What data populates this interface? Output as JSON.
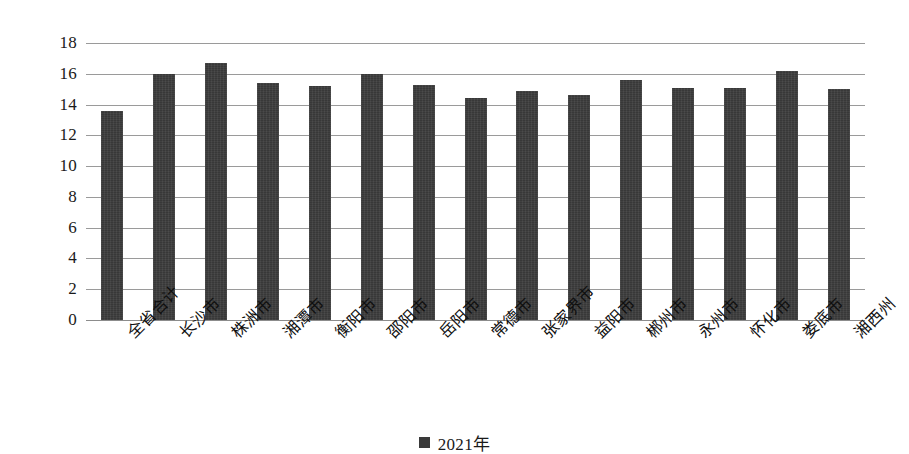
{
  "chart_data": {
    "type": "bar",
    "title": "",
    "xlabel": "",
    "ylabel": "",
    "ylim": [
      0,
      18
    ],
    "ytick_step": 2,
    "yticks": [
      18,
      16,
      14,
      12,
      10,
      8,
      6,
      4,
      2,
      0
    ],
    "grid": true,
    "legend_position": "bottom",
    "legend": [
      "2021年"
    ],
    "series_name": "2021年",
    "bar_color": "#383838",
    "gridline_color": "#9a9a9a",
    "categories": [
      "全省合计",
      "长沙市",
      "株洲市",
      "湘潭市",
      "衡阳市",
      "邵阳市",
      "岳阳市",
      "常德市",
      "张家界市",
      "益阳市",
      "郴州市",
      "永州市",
      "怀化市",
      "娄底市",
      "湘西州"
    ],
    "values": [
      13.6,
      16.0,
      16.7,
      15.4,
      15.2,
      16.0,
      15.3,
      14.4,
      14.9,
      14.6,
      15.6,
      15.1,
      15.1,
      16.2,
      15.0
    ],
    "series": [
      {
        "name": "2021年",
        "values": [
          13.6,
          16.0,
          16.7,
          15.4,
          15.2,
          16.0,
          15.3,
          14.4,
          14.9,
          14.6,
          15.6,
          15.1,
          15.1,
          16.2,
          15.0
        ]
      }
    ]
  }
}
